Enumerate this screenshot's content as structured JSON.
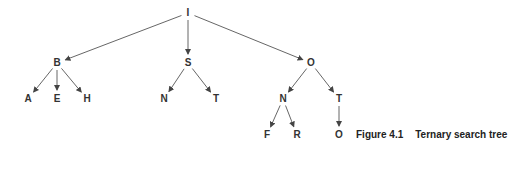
{
  "diagram": {
    "title": "Ternary search tree",
    "nodes": [
      {
        "id": "I",
        "label": "I",
        "x": 188,
        "y": 13
      },
      {
        "id": "B",
        "label": "B",
        "x": 57,
        "y": 63
      },
      {
        "id": "S",
        "label": "S",
        "x": 188,
        "y": 63
      },
      {
        "id": "O1",
        "label": "O",
        "x": 311,
        "y": 63
      },
      {
        "id": "A",
        "label": "A",
        "x": 28,
        "y": 99
      },
      {
        "id": "E",
        "label": "E",
        "x": 57,
        "y": 99
      },
      {
        "id": "H",
        "label": "H",
        "x": 87,
        "y": 99
      },
      {
        "id": "N1",
        "label": "N",
        "x": 164,
        "y": 99
      },
      {
        "id": "T1",
        "label": "T",
        "x": 216,
        "y": 99
      },
      {
        "id": "N2",
        "label": "N",
        "x": 283,
        "y": 99
      },
      {
        "id": "T2",
        "label": "T",
        "x": 339,
        "y": 99
      },
      {
        "id": "F",
        "label": "F",
        "x": 267,
        "y": 135
      },
      {
        "id": "R",
        "label": "R",
        "x": 297,
        "y": 135
      },
      {
        "id": "O2",
        "label": "O",
        "x": 339,
        "y": 135
      }
    ],
    "edges": [
      [
        "I",
        "B"
      ],
      [
        "I",
        "S"
      ],
      [
        "I",
        "O1"
      ],
      [
        "B",
        "A"
      ],
      [
        "B",
        "E"
      ],
      [
        "B",
        "H"
      ],
      [
        "S",
        "N1"
      ],
      [
        "S",
        "T1"
      ],
      [
        "O1",
        "N2"
      ],
      [
        "O1",
        "T2"
      ],
      [
        "N2",
        "F"
      ],
      [
        "N2",
        "R"
      ],
      [
        "T2",
        "O2"
      ]
    ],
    "edge_color": "#555555"
  },
  "caption": {
    "number": "Figure 4.1",
    "text": "Ternary search tree"
  }
}
